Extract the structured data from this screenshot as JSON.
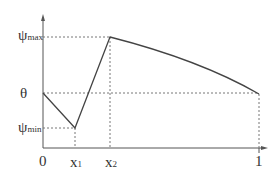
{
  "diagram": {
    "type": "piecewise function plot",
    "y_labels": {
      "psi_max": {
        "symbol": "ψ",
        "sub": "max"
      },
      "theta": "θ",
      "psi_min": {
        "symbol": "ψ",
        "sub": "min"
      }
    },
    "x_labels": {
      "origin": "0",
      "x1": {
        "symbol": "x",
        "sub": "1"
      },
      "x2": {
        "symbol": "x",
        "sub": "2"
      },
      "one": "1"
    },
    "colors": {
      "curve": "#444444",
      "axis": "#555555",
      "guide": "#666666"
    }
  }
}
